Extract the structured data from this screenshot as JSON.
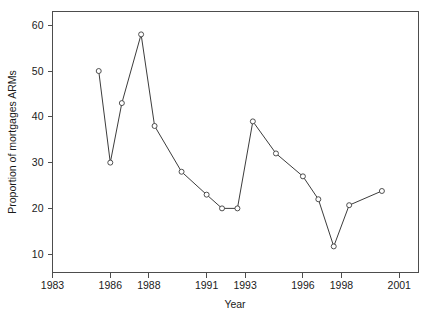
{
  "chart_data": {
    "type": "line",
    "title": "",
    "subtitle": "",
    "xlabel": "Year",
    "ylabel": "Proportion of mortgages ARMs",
    "xlim": [
      1983,
      2002
    ],
    "ylim": [
      6,
      63
    ],
    "grid": false,
    "legend": null,
    "xticks": [
      1983,
      1986,
      1988,
      1991,
      1993,
      1996,
      1998,
      2001
    ],
    "xtick_labels": [
      "1983",
      "1986",
      "1988",
      "1991",
      "1993",
      "1996",
      "1998",
      "2001"
    ],
    "yticks": [
      10,
      20,
      30,
      40,
      50,
      60
    ],
    "ytick_labels": [
      "10",
      "20",
      "30",
      "40",
      "50",
      "60"
    ],
    "marker": "open-circle",
    "line_color": "#3c3c3c",
    "marker_face_color": "#ffffff",
    "axis_color": "#4d4d4d",
    "background_color": "#ffffff",
    "x": [
      1985.4,
      1986.0,
      1986.6,
      1987.6,
      1988.3,
      1989.7,
      1991.0,
      1991.8,
      1992.6,
      1993.4,
      1994.6,
      1996.0,
      1996.8,
      1997.6,
      1998.4,
      2000.1
    ],
    "values": [
      50.0,
      30.0,
      43.0,
      58.0,
      38.0,
      28.0,
      23.0,
      20.0,
      20.0,
      39.0,
      32.0,
      27.0,
      22.0,
      11.7,
      20.7,
      23.8
    ],
    "series": [
      {
        "name": "Proportion of mortgages ARMs",
        "x": [
          1985.4,
          1986.0,
          1986.6,
          1987.6,
          1988.3,
          1989.7,
          1991.0,
          1991.8,
          1992.6,
          1993.4,
          1994.6,
          1996.0,
          1996.8,
          1997.6,
          1998.4,
          2000.1
        ],
        "values": [
          50.0,
          30.0,
          43.0,
          58.0,
          38.0,
          28.0,
          23.0,
          20.0,
          20.0,
          39.0,
          32.0,
          27.0,
          22.0,
          11.7,
          20.7,
          23.8
        ]
      }
    ]
  }
}
